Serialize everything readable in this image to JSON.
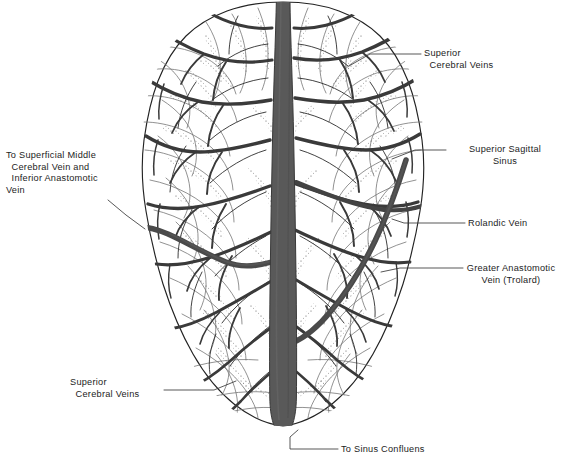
{
  "figure": {
    "background_color": "#ffffff",
    "ink_color": "#1c1c1c",
    "vessel_fill": "#595959",
    "vessel_stroke": "#3a3a3a",
    "outline_color": "#222222",
    "gyri_color": "#6a6a6a",
    "stipple_color": "#555555",
    "leader_color": "#3a3a3a"
  },
  "labels": [
    {
      "id": "superior-cerebral-veins-top",
      "name": "superior-cerebral-veins-top-label",
      "lines": [
        "Superior",
        "  Cerebral Veins"
      ],
      "text": "Superior Cerebral Veins",
      "align": "left",
      "x": 424,
      "y": 48
    },
    {
      "id": "superior-sagittal-sinus",
      "name": "superior-sagittal-sinus-label",
      "lines": [
        "Superior Sagittal",
        "Sinus"
      ],
      "text": "Superior Sagittal Sinus",
      "align": "center",
      "x": 449,
      "y": 144
    },
    {
      "id": "rolandic-vein",
      "name": "rolandic-vein-label",
      "lines": [
        "Rolandic Vein"
      ],
      "text": "Rolandic Vein",
      "align": "left",
      "x": 468,
      "y": 218
    },
    {
      "id": "greater-anastomotic-vein",
      "name": "greater-anastomotic-vein-label",
      "lines": [
        "Greater Anastomotic",
        "Vein (Trolard)"
      ],
      "text": "Greater Anastomotic Vein (Trolard)",
      "align": "center",
      "x": 466,
      "y": 263
    },
    {
      "id": "to-superficial-middle-cerebral-vein",
      "name": "superficial-middle-cerebral-vein-label",
      "lines": [
        "To Superficial Middle",
        "  Cerebral Vein and",
        "  Inferior Anastomotic",
        "Vein"
      ],
      "text": "To Superficial Middle Cerebral Vein and Inferior Anastomotic Vein",
      "align": "left",
      "x": 6,
      "y": 150
    },
    {
      "id": "superior-cerebral-veins-bottom",
      "name": "superior-cerebral-veins-bottom-label",
      "lines": [
        "Superior",
        "  Cerebral Veins"
      ],
      "text": "Superior Cerebral Veins",
      "align": "left",
      "x": 70,
      "y": 377
    },
    {
      "id": "to-sinus-confluens",
      "name": "sinus-confluens-label",
      "lines": [
        "To Sinus Confluens"
      ],
      "text": "To Sinus Confluens",
      "align": "left",
      "x": 341,
      "y": 444
    }
  ],
  "structures": {
    "superior_sagittal_sinus": "superior-sagittal-sinus",
    "rolandic_vein": "rolandic-vein",
    "trolard_vein": "greater-anastomotic-vein-trolard",
    "superior_cerebral_veins": "superior-cerebral-veins",
    "brain_outline": "cerebral-hemispheres-outline",
    "sulci_stipple": "sulci-stipple-texture"
  }
}
